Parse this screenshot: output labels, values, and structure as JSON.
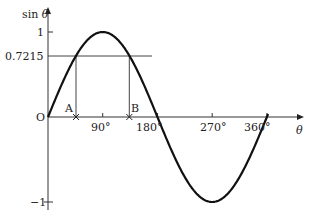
{
  "chart_data": {
    "type": "line",
    "title": "",
    "xlabel": "θ",
    "ylabel": "sin θ",
    "function": "sin θ",
    "x_range_deg": [
      0,
      360
    ],
    "ylim": [
      -1,
      1
    ],
    "grid": false,
    "x_ticks": [
      {
        "value": 90,
        "label": "90°"
      },
      {
        "value": 180,
        "label": "180°"
      },
      {
        "value": 270,
        "label": "270°"
      },
      {
        "value": 360,
        "label": "360°"
      }
    ],
    "y_ticks": [
      {
        "value": 1,
        "label": "1"
      },
      {
        "value": 0.7215,
        "label": "0.7215"
      },
      {
        "value": -1,
        "label": "−1"
      }
    ],
    "origin_label": "O",
    "series": [
      {
        "name": "sin θ",
        "x": [
          0,
          15,
          30,
          45,
          60,
          75,
          90,
          105,
          120,
          135,
          150,
          165,
          180,
          195,
          210,
          225,
          240,
          255,
          270,
          285,
          300,
          315,
          330,
          345,
          360
        ],
        "values": [
          0,
          0.2588,
          0.5,
          0.7071,
          0.866,
          0.9659,
          1,
          0.9659,
          0.866,
          0.7071,
          0.5,
          0.2588,
          0,
          -0.2588,
          -0.5,
          -0.7071,
          -0.866,
          -0.9659,
          -1,
          -0.9659,
          -0.866,
          -0.7071,
          -0.5,
          -0.2588,
          0
        ]
      }
    ],
    "reference_line": {
      "y": 0.7215,
      "label": "0.7215"
    },
    "annotations": [
      {
        "label": "A",
        "x_deg": 46.2,
        "y": 0.7215,
        "marker": "cross on θ-axis"
      },
      {
        "label": "B",
        "x_deg": 133.8,
        "y": 0.7215,
        "marker": "cross on θ-axis"
      }
    ]
  },
  "labels": {
    "y_axis": "sin θ",
    "x_axis": "θ",
    "origin": "O",
    "y_one": "1",
    "y_ref": "0.7215",
    "y_minus_one": "−1",
    "tick_90": "90°",
    "tick_180": "180°",
    "tick_270": "270°",
    "tick_360": "360°",
    "point_a": "A",
    "point_b": "B"
  },
  "colors": {
    "curve": "#111111",
    "axis": "#333333",
    "background": "#ffffff"
  }
}
